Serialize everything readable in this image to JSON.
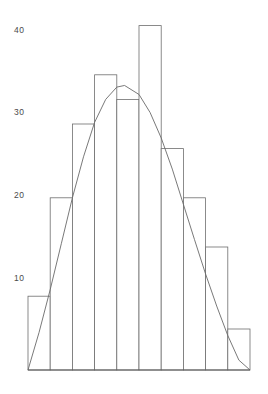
{
  "chart_data": {
    "type": "bar",
    "title": "",
    "subtitle": "",
    "xlabel": "",
    "ylabel": "",
    "categories": [
      "1",
      "2",
      "3",
      "4",
      "5",
      "6",
      "7",
      "8",
      "9",
      "10"
    ],
    "values": [
      9,
      21,
      30,
      36,
      33,
      42,
      27,
      21,
      15,
      5
    ],
    "ylim": [
      0,
      45
    ],
    "xlim": [
      0,
      10
    ],
    "yticks": [
      10,
      20,
      30,
      40
    ],
    "ytick_labels": [
      "10",
      "20",
      "30",
      "40"
    ],
    "xticks": [],
    "xtick_labels": [],
    "grid": false,
    "legend": null,
    "legend_position": "none",
    "annotations": [],
    "series": [
      {
        "name": "histogram",
        "type": "bar",
        "values": [
          9,
          21,
          30,
          36,
          33,
          42,
          27,
          21,
          15,
          5
        ]
      },
      {
        "name": "normal-curve",
        "type": "line",
        "peak_value": 34.7,
        "peak_x": 4.35,
        "x": [
          0.0,
          0.5,
          1.0,
          1.5,
          2.0,
          2.5,
          3.0,
          3.5,
          4.0,
          4.35,
          5.0,
          5.5,
          6.0,
          6.5,
          7.0,
          7.5,
          8.0,
          8.5,
          9.0,
          9.5
        ],
        "values": [
          0.0,
          4.6,
          9.8,
          15.4,
          21.0,
          26.0,
          30.2,
          33.0,
          34.5,
          34.7,
          33.6,
          31.4,
          28.3,
          24.5,
          20.2,
          15.9,
          11.7,
          7.8,
          4.2,
          1.2
        ]
      }
    ],
    "colors": {
      "bar_fill": "#ffffff",
      "bar_stroke": "#6e6e6e",
      "axis": "#5a5a5a",
      "curve": "#6a6a6a",
      "tick_text": "#4a4a4a",
      "background": "#ffffff"
    }
  },
  "axis": {
    "baseline_y_px": 370,
    "left_x_px": 28,
    "right_x_px": 250,
    "unit_px_per_value": 8.2
  }
}
